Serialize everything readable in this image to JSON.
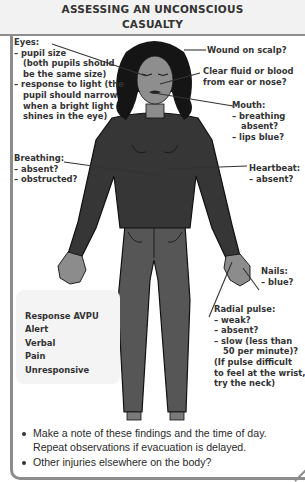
{
  "title": "ASSESSING AN UNCONSCIOUS CASUALTY",
  "title_lines": [
    "ASSESSING AN UNCONSCIOUS",
    "CASUALTY"
  ],
  "labels": {
    "eyes": {
      "heading": "Eyes:",
      "lines": [
        "– pupil size",
        "(both pupils should",
        "be the same size)",
        "– response to light (the",
        "pupil should narrow",
        "when a bright light",
        "shines in the eye)"
      ]
    },
    "scalp": {
      "heading": "Wound on scalp?"
    },
    "fluid": {
      "lines": [
        "Clear fluid or blood",
        "from ear or nose?"
      ]
    },
    "mouth": {
      "heading": "Mouth:",
      "lines": [
        "– breathing",
        "absent?",
        "– lips blue?"
      ]
    },
    "breathing": {
      "heading": "Breathing:",
      "lines": [
        "– absent?",
        "– obstructed?"
      ]
    },
    "heartbeat": {
      "heading": "Heartbeat:",
      "lines": [
        "– absent?"
      ]
    },
    "nails": {
      "heading": "Nails:",
      "lines": [
        "– blue?"
      ]
    },
    "radial_pulse": {
      "heading": "Radial pulse:",
      "lines": [
        "– weak?",
        "– absent?",
        "– slow (less than",
        "50 per minute)?",
        "(If pulse difficult",
        "to feel at the wrist,",
        "try the neck)"
      ]
    }
  },
  "avpu": {
    "heading": "Response AVPU",
    "items": [
      "Alert",
      "Verbal",
      "Pain",
      "Unresponsive"
    ]
  },
  "bullets": [
    "Make a note of these findings and the time of day. Repeat observations if evacuation is delayed.",
    "Other injuries elsewhere on the body?"
  ],
  "colors": {
    "border": "#8c8c8c",
    "header_bg": "#f2f2f2",
    "avpu_bg": "#f4f4f4",
    "sweater": "#3a3a3a",
    "pants": "#555555",
    "skin": "#8a8a8a",
    "hair": "#1a1a1a",
    "text": "#333333"
  }
}
